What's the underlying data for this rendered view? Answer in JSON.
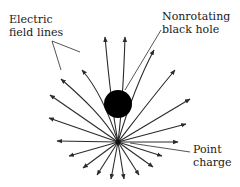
{
  "diagram": {
    "labels": {
      "field_lines": {
        "line1": "Electric",
        "line2": "field lines"
      },
      "black_hole": {
        "line1": "Nonrotating",
        "line2": "black hole"
      },
      "point_charge": {
        "line1": "Point",
        "line2": "charge"
      }
    },
    "colors": {
      "line": "#2a2a2a",
      "black_hole": "#000000",
      "text": "#1a1a1a",
      "background": "#ffffff"
    },
    "point_charge_center": [
      118,
      142
    ],
    "black_hole_center": [
      118,
      104
    ],
    "black_hole_radius": 14
  }
}
